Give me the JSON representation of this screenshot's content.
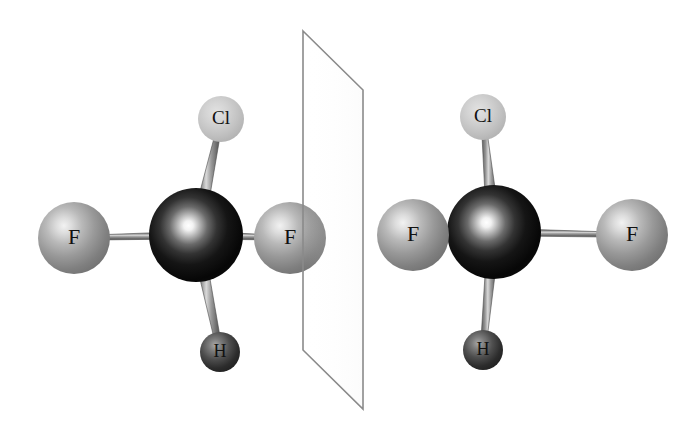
{
  "figure": {
    "name": "mirror-plane-enantiomers",
    "background_color": "#ffffff",
    "width": 700,
    "height": 431
  },
  "mirror_plane": {
    "name": "mirror-plane",
    "label": "",
    "stroke_color": "#8a8a8a",
    "fill_color": "#ffffff",
    "corners": [
      {
        "x": 303,
        "y": 31
      },
      {
        "x": 363,
        "y": 90
      },
      {
        "x": 363,
        "y": 409
      },
      {
        "x": 303,
        "y": 350
      }
    ]
  },
  "colors": {
    "carbon_dark": "#0b0b0b",
    "carbon_highlight": "#ffffff",
    "fluorine_base": "#8c8c8c",
    "fluorine_highlight": "#e8e8e8",
    "chlorine_base": "#b8b8b8",
    "chlorine_highlight": "#dedede",
    "hydrogen_base": "#3a3a3a",
    "hydrogen_highlight": "#8e8e8e",
    "bond_base": "#707070",
    "bond_highlight": "#d8d8d8",
    "label_text": "#111111",
    "plane_stroke": "#8a8a8a"
  },
  "molecules": [
    {
      "name": "molecule-left",
      "formula": "CHClF2",
      "side": "left",
      "atoms": [
        {
          "id": "C-left",
          "element": "C",
          "label": "",
          "cx": 196,
          "cy": 235,
          "r": 47,
          "kind": "carbon"
        },
        {
          "id": "F1-left",
          "element": "F",
          "label": "F",
          "cx": 74,
          "cy": 238,
          "r": 36,
          "kind": "fluorine"
        },
        {
          "id": "F2-left",
          "element": "F",
          "label": "F",
          "cx": 290,
          "cy": 238,
          "r": 36,
          "kind": "fluorine"
        },
        {
          "id": "Cl-left",
          "element": "Cl",
          "label": "Cl",
          "cx": 221,
          "cy": 119,
          "r": 23,
          "kind": "chlorine"
        },
        {
          "id": "H-left",
          "element": "H",
          "label": "H",
          "cx": 220,
          "cy": 352,
          "r": 20,
          "kind": "hydrogen"
        }
      ],
      "bonds": [
        {
          "id": "C-F1-left",
          "from": "C-left",
          "to": "F1-left",
          "w1": 7,
          "w2": 5
        },
        {
          "id": "C-F2-left",
          "from": "C-left",
          "to": "F2-left",
          "w1": 7,
          "w2": 5
        },
        {
          "id": "C-Cl-left",
          "from": "C-left",
          "to": "Cl-left",
          "w1": 12,
          "w2": 5
        },
        {
          "id": "C-H-left",
          "from": "C-left",
          "to": "H-left",
          "w1": 11,
          "w2": 6
        }
      ]
    },
    {
      "name": "molecule-right",
      "formula": "CHClF2",
      "side": "right",
      "atoms": [
        {
          "id": "C-right",
          "element": "C",
          "label": "",
          "cx": 494,
          "cy": 232,
          "r": 47,
          "kind": "carbon"
        },
        {
          "id": "F1-right",
          "element": "F",
          "label": "F",
          "cx": 413,
          "cy": 235,
          "r": 36,
          "kind": "fluorine"
        },
        {
          "id": "F2-right",
          "element": "F",
          "label": "F",
          "cx": 632,
          "cy": 235,
          "r": 36,
          "kind": "fluorine"
        },
        {
          "id": "Cl-right",
          "element": "Cl",
          "label": "Cl",
          "cx": 483,
          "cy": 117,
          "r": 23,
          "kind": "chlorine"
        },
        {
          "id": "H-right",
          "element": "H",
          "label": "H",
          "cx": 483,
          "cy": 350,
          "r": 20,
          "kind": "hydrogen"
        }
      ],
      "bonds": [
        {
          "id": "C-F1-right",
          "from": "C-right",
          "to": "F1-right",
          "w1": 7,
          "w2": 5
        },
        {
          "id": "C-F2-right",
          "from": "C-right",
          "to": "F2-right",
          "w1": 7,
          "w2": 5
        },
        {
          "id": "C-Cl-right",
          "from": "C-right",
          "to": "Cl-right",
          "w1": 12,
          "w2": 5
        },
        {
          "id": "C-H-right",
          "from": "C-right",
          "to": "H-right",
          "w1": 11,
          "w2": 6
        }
      ]
    }
  ],
  "labels": {
    "fluorine": "F",
    "chlorine": "Cl",
    "hydrogen": "H"
  }
}
